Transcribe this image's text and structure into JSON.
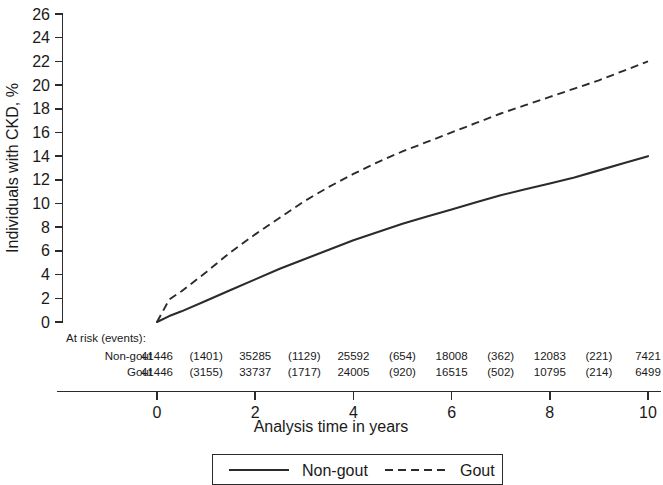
{
  "chart_data": {
    "type": "line",
    "title": "",
    "xlabel": "Analysis time in years",
    "ylabel": "Individuals with CKD, %",
    "xlim": [
      0,
      10
    ],
    "ylim": [
      0,
      26
    ],
    "xticks": [
      0,
      2,
      4,
      6,
      8,
      10
    ],
    "yticks": [
      0,
      2,
      4,
      6,
      8,
      10,
      12,
      14,
      16,
      18,
      20,
      22,
      24,
      26
    ],
    "xtick_labels": [
      "0",
      "2",
      "4",
      "6",
      "8",
      "10"
    ],
    "ytick_labels": [
      "0",
      "2",
      "4",
      "6",
      "8",
      "10",
      "12",
      "14",
      "16",
      "18",
      "20",
      "22",
      "24",
      "26"
    ],
    "grid": false,
    "legend_position": "bottom",
    "x": [
      0,
      0.25,
      0.5,
      1,
      1.5,
      2,
      2.5,
      3,
      3.5,
      4,
      4.5,
      5,
      5.5,
      6,
      6.5,
      7,
      7.5,
      8,
      8.5,
      9,
      9.5,
      10
    ],
    "series": [
      {
        "name": "Non-gout",
        "style": "solid",
        "color": "#2b2b2b",
        "values": [
          0,
          0.5,
          0.9,
          1.8,
          2.7,
          3.6,
          4.5,
          5.3,
          6.1,
          6.9,
          7.6,
          8.3,
          8.9,
          9.5,
          10.1,
          10.7,
          11.2,
          11.7,
          12.2,
          12.8,
          13.4,
          14.0
        ]
      },
      {
        "name": "Gout",
        "style": "dashed",
        "color": "#2b2b2b",
        "values": [
          0,
          1.9,
          2.6,
          4.2,
          5.9,
          7.4,
          8.8,
          10.2,
          11.4,
          12.5,
          13.5,
          14.4,
          15.2,
          16.0,
          16.8,
          17.6,
          18.3,
          19.0,
          19.7,
          20.4,
          21.2,
          22.0
        ]
      }
    ],
    "at_risk": {
      "heading": "At risk (events):",
      "row_labels": [
        "Non-gout",
        "Gout"
      ],
      "time_points": [
        0,
        2,
        4,
        6,
        8,
        10
      ],
      "rows": [
        {
          "label": "Non-gout",
          "at_risk": [
            "41446",
            "35285",
            "25592",
            "18008",
            "12083",
            "7421"
          ],
          "events": [
            "(1401)",
            "(1129)",
            "(654)",
            "(362)",
            "(221)"
          ]
        },
        {
          "label": "Gout",
          "at_risk": [
            "41446",
            "33737",
            "24005",
            "16515",
            "10795",
            "6499"
          ],
          "events": [
            "(3155)",
            "(1717)",
            "(920)",
            "(502)",
            "(214)"
          ]
        }
      ]
    },
    "legend": [
      {
        "label": "Non-gout",
        "style": "solid"
      },
      {
        "label": "Gout",
        "style": "dashed"
      }
    ]
  }
}
